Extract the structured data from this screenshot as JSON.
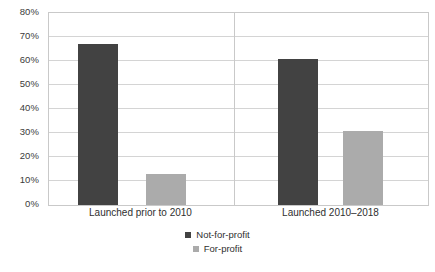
{
  "chart_data": {
    "type": "bar",
    "title": "",
    "xlabel": "",
    "ylabel": "",
    "categories": [
      "Launched prior to 2010",
      "Launched 2010–2018"
    ],
    "series": [
      {
        "name": "Not-for-profit",
        "color": "#424242",
        "values": [
          67,
          61
        ]
      },
      {
        "name": "For-profit",
        "color": "#ababab",
        "values": [
          13,
          31
        ]
      }
    ],
    "ylim": [
      0,
      80
    ],
    "ytick_step": 10,
    "ytick_labels": [
      "0%",
      "10%",
      "20%",
      "30%",
      "40%",
      "50%",
      "60%",
      "70%",
      "80%"
    ],
    "ytick_values": [
      0,
      10,
      20,
      30,
      40,
      50,
      60,
      70,
      80
    ],
    "grid": true,
    "legend_position": "bottom"
  },
  "axis": {
    "y": {
      "t0": "0%",
      "t1": "10%",
      "t2": "20%",
      "t3": "30%",
      "t4": "40%",
      "t5": "50%",
      "t6": "60%",
      "t7": "70%",
      "t8": "80%"
    },
    "x": {
      "cat0": "Launched prior to 2010",
      "cat1": "Launched 2010–2018"
    }
  },
  "legend": {
    "items": [
      {
        "label": "Not-for-profit"
      },
      {
        "label": "For-profit"
      }
    ]
  }
}
